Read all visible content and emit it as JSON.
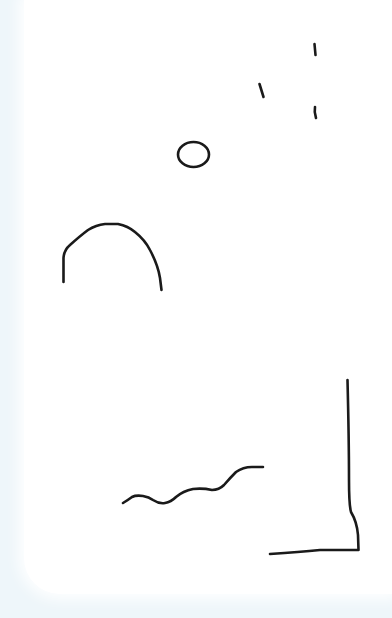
{
  "canvas": {
    "background": "#ffffff",
    "backdrop": "#eef6fa",
    "stroke_color": "#1a1a1a",
    "width": 392,
    "height": 618
  },
  "strokes": [
    {
      "name": "tick-mark-top-right",
      "d": "M314.5,44 L315.5,55"
    },
    {
      "name": "tick-mark-middle",
      "d": "M259.5,84 L263.5,97"
    },
    {
      "name": "tick-mark-lower-right",
      "d": "M315,107 Q314,112 316,118"
    },
    {
      "name": "arch",
      "d": "M63.5,282 L63.5,258 Q64,250 70,245 Q80,236 88,230 Q96,225 105,224 L118,224 Q128,226 135,232 Q145,240 150,250 Q158,265 160,278 L161.5,290"
    },
    {
      "name": "wave-line",
      "d": "M123,503 Q128,500 132,497 Q136,495 143,496 Q149,497 153,500 Q159,504 165,503 Q171,502 176,497 Q183,491 193,489 Q203,488 212,490 Q219,490 224,485 Q230,478 236,472 Q243,467 252,467 L263,467"
    },
    {
      "name": "corner-bracket",
      "d": "M347.5,380 Q349,440 349,480 Q349,505 351,512 Q357,522 358,535 L358.5,550 L320,550 Q300,552 270,554"
    }
  ],
  "shapes": [
    {
      "name": "small-circle",
      "cx": 193.5,
      "cy": 154.5,
      "rx": 15.5,
      "ry": 12.5
    }
  ]
}
